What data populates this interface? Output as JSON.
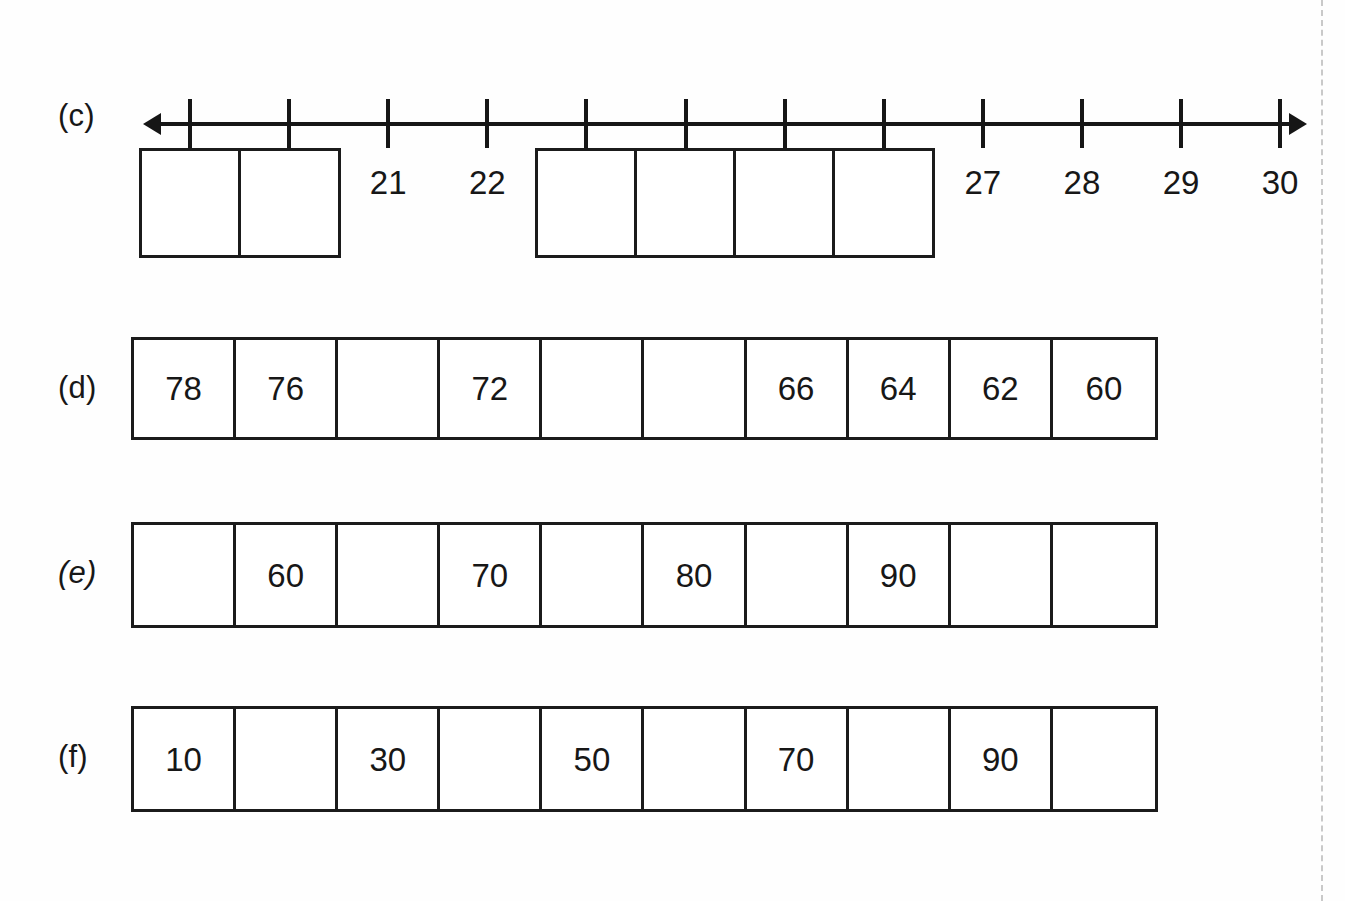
{
  "worksheet": {
    "background_color": "#fefefe",
    "ink_color": "#171717",
    "fold_line_color": "#c9c9c9"
  },
  "parts": {
    "c": {
      "label": "(c)"
    },
    "d": {
      "label": "(d)"
    },
    "e": {
      "label": "(e)"
    },
    "f": {
      "label": "(f)"
    }
  },
  "chart_data": [
    {
      "type": "table",
      "name": "part-c-number-line",
      "title": "(c)",
      "description": "Number line from 19 to 30 with 12 tick marks; some positions are printed numbers, others are empty answer boxes to fill in.",
      "tick_count": 12,
      "labels": [
        "",
        "",
        "21",
        "22",
        "",
        "",
        "",
        "",
        "27",
        "28",
        "29",
        "30"
      ],
      "filled": [
        false,
        false,
        true,
        true,
        false,
        false,
        false,
        false,
        true,
        true,
        true,
        true
      ],
      "left_arrow": true,
      "right_arrow": true
    },
    {
      "type": "table",
      "name": "part-d-sequence",
      "title": "(d)",
      "description": "Counting backwards in twos from 78 to 60; blanks to complete.",
      "cells": [
        "78",
        "76",
        "",
        "72",
        "",
        "",
        "66",
        "64",
        "62",
        "60"
      ],
      "step": -2,
      "cell_count": 10
    },
    {
      "type": "table",
      "name": "part-e-sequence",
      "title": "(e)",
      "description": "Counting on in tens; every other cell is printed, blanks to complete.",
      "cells": [
        "",
        "60",
        "",
        "70",
        "",
        "80",
        "",
        "90",
        "",
        ""
      ],
      "step": 10,
      "cell_count": 10
    },
    {
      "type": "table",
      "name": "part-f-sequence",
      "title": "(f)",
      "description": "Counting on in tens starting at 10; every other cell is printed, blanks to complete.",
      "cells": [
        "10",
        "",
        "30",
        "",
        "50",
        "",
        "70",
        "",
        "90",
        ""
      ],
      "step": 10,
      "cell_count": 10
    }
  ]
}
